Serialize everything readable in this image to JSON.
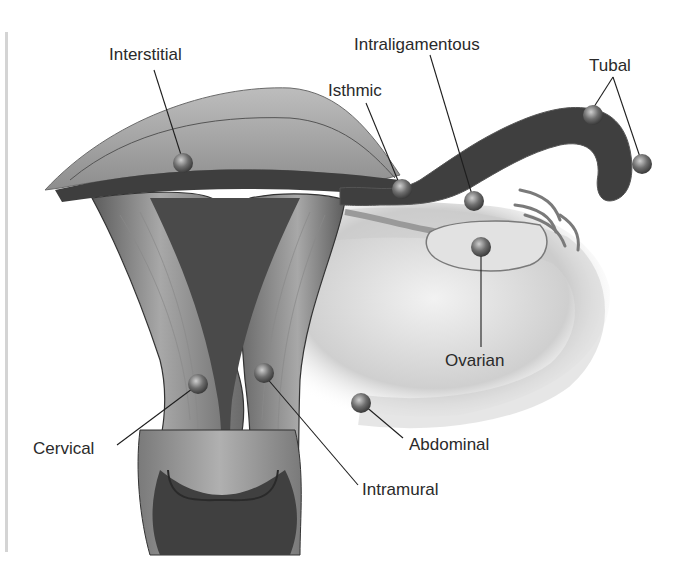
{
  "figure": {
    "colors": {
      "background": "#ffffff",
      "tissue_light": "#d8d8d8",
      "tissue_mid": "#9a9a9a",
      "tissue_dark": "#3e3e3e",
      "leader_line": "#1e1e1e",
      "label_text": "#2a2a2a",
      "site_marker": "#5a5a5a"
    },
    "labels": [
      {
        "id": "interstitial",
        "text": "Interstitial"
      },
      {
        "id": "isthmic",
        "text": "Isthmic"
      },
      {
        "id": "intraligamentous",
        "text": "Intraligamentous"
      },
      {
        "id": "tubal",
        "text": "Tubal"
      },
      {
        "id": "ovarian",
        "text": "Ovarian"
      },
      {
        "id": "abdominal",
        "text": "Abdominal"
      },
      {
        "id": "intramural",
        "text": "Intramural"
      },
      {
        "id": "cervical",
        "text": "Cervical"
      }
    ]
  }
}
